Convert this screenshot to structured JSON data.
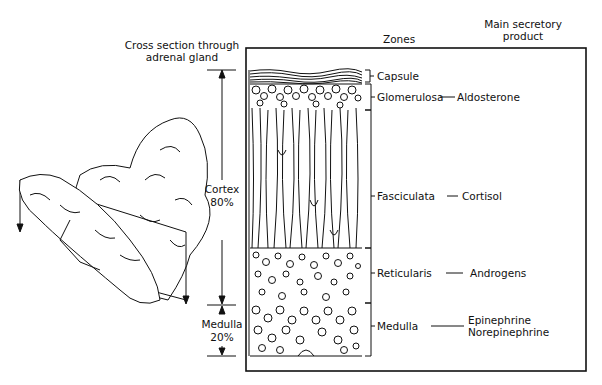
{
  "figure": {
    "left_title_line1": "Cross section through",
    "left_title_line2": "adrenal gland",
    "zones_header": "Zones",
    "product_header_line1": "Main secretory",
    "product_header_line2": "product"
  },
  "regions": {
    "cortex": {
      "label": "Cortex",
      "percent": "80%"
    },
    "medulla": {
      "label": "Medulla",
      "percent": "20%"
    }
  },
  "zones": [
    {
      "name": "Capsule",
      "product": ""
    },
    {
      "name": "Glomerulosa",
      "product": "Aldosterone"
    },
    {
      "name": "Fasciculata",
      "product": "Cortisol"
    },
    {
      "name": "Reticularis",
      "product": "Androgens"
    },
    {
      "name": "Medulla",
      "product_line1": "Epinephrine",
      "product_line2": "Norepinephrine"
    }
  ],
  "colors": {
    "ink": "#111111",
    "background": "#ffffff"
  }
}
